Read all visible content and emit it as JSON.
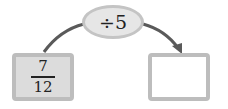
{
  "operation": {
    "label": "÷5"
  },
  "input": {
    "numerator": "7",
    "denominator": "12"
  },
  "output": {
    "value": ""
  },
  "colors": {
    "arrow": "#5a5a5a",
    "input_fill": "#dcdcdc",
    "border": "#bdbdbd",
    "oval_fill": "#e6e6e6"
  }
}
